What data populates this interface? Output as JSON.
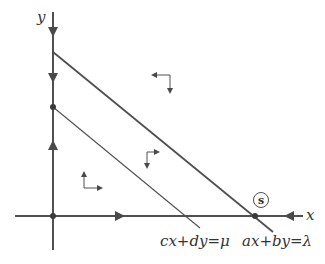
{
  "diagram": {
    "type": "phase-portrait",
    "colors": {
      "stroke": "#505050",
      "background": "#ffffff"
    },
    "axes": {
      "x_label": "x",
      "y_label": "y",
      "origin": [
        53,
        216
      ],
      "x_axis": {
        "from": [
          15,
          216
        ],
        "to": [
          303,
          216
        ]
      },
      "y_axis": {
        "from": [
          53,
          250
        ],
        "to": [
          53,
          12
        ]
      }
    },
    "lines": [
      {
        "id": "ax_by_lambda",
        "label": "ax+by=λ",
        "from": [
          53,
          52
        ],
        "to": [
          273,
          232
        ]
      },
      {
        "id": "cx_dy_mu",
        "label": "cx+dy=μ",
        "from": [
          53,
          107
        ],
        "to": [
          200,
          228
        ]
      }
    ],
    "points": [
      {
        "id": "origin",
        "at": [
          53,
          216
        ]
      },
      {
        "id": "y_intercept_mu",
        "at": [
          53,
          107
        ]
      },
      {
        "id": "steady_state",
        "at": [
          255,
          216
        ],
        "label": "s"
      }
    ],
    "axis_arrows": [
      {
        "at": [
          53,
          32
        ],
        "dir": "down"
      },
      {
        "at": [
          53,
          78
        ],
        "dir": "down"
      },
      {
        "at": [
          53,
          145
        ],
        "dir": "up"
      },
      {
        "at": [
          120,
          216
        ],
        "dir": "right"
      },
      {
        "at": [
          289,
          216
        ],
        "dir": "left"
      }
    ],
    "region_arrows": [
      {
        "region": "above-both-lines",
        "corner": [
          170,
          75
        ],
        "horizontal": "left",
        "vertical": "down"
      },
      {
        "region": "between-lines",
        "corner": [
          147,
          152
        ],
        "horizontal": "right",
        "vertical": "down"
      },
      {
        "region": "below-both-lines",
        "corner": [
          84,
          188
        ],
        "horizontal": "right",
        "vertical": "up"
      }
    ],
    "labels": {
      "x": "x",
      "y": "y",
      "line_mu": "cx+dy=μ",
      "line_lambda": "ax+by=λ",
      "steady_state": "s"
    }
  }
}
